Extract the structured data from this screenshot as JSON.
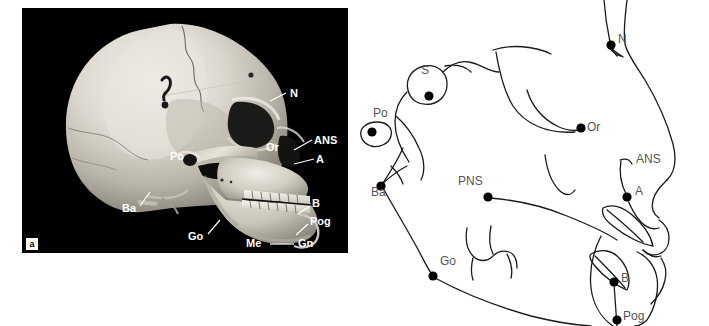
{
  "figure": {
    "panel_letter": "a",
    "background_color": "#ffffff",
    "photo_background_color": "#000000",
    "label_color_photo": "#ffffff",
    "label_color_tracing": "#555555",
    "trace_stroke_color": "#1a1a1a"
  },
  "photo_panel": {
    "name": "skull-photograph",
    "labels": [
      {
        "id": "N",
        "text": "N",
        "x": 290,
        "y": 86,
        "leader": {
          "x1": 286,
          "y1": 93,
          "x2": 268,
          "y2": 101
        }
      },
      {
        "id": "ANS",
        "text": "ANS",
        "x": 317,
        "y": 139,
        "leader": {
          "x1": 315,
          "y1": 147,
          "x2": 295,
          "y2": 155
        }
      },
      {
        "id": "A",
        "text": "A",
        "x": 318,
        "y": 158,
        "leader": {
          "x1": 315,
          "y1": 158,
          "x2": 293,
          "y2": 163
        }
      },
      {
        "id": "Or",
        "text": "Or",
        "x": 268,
        "y": 142,
        "leader": null
      },
      {
        "id": "Po",
        "text": "Po",
        "x": 172,
        "y": 150,
        "leader": null
      },
      {
        "id": "Ba",
        "text": "Ba",
        "x": 130,
        "y": 210,
        "leader": {
          "x1": 143,
          "y1": 205,
          "x2": 153,
          "y2": 190
        }
      },
      {
        "id": "Go",
        "text": "Go",
        "x": 196,
        "y": 237,
        "leader": {
          "x1": 208,
          "y1": 233,
          "x2": 220,
          "y2": 219
        }
      },
      {
        "id": "Me",
        "text": "Me",
        "x": 253,
        "y": 241,
        "leader": {
          "x1": 271,
          "y1": 243,
          "x2": 296,
          "y2": 243
        }
      },
      {
        "id": "Gn",
        "text": "Gn",
        "x": 300,
        "y": 241,
        "leader": null
      },
      {
        "id": "B",
        "text": "B",
        "x": 312,
        "y": 205,
        "leader": {
          "x1": 310,
          "y1": 208,
          "x2": 296,
          "y2": 214
        }
      },
      {
        "id": "Pog",
        "text": "Pog",
        "x": 310,
        "y": 222,
        "leader": {
          "x1": 308,
          "y1": 228,
          "x2": 296,
          "y2": 237
        }
      }
    ]
  },
  "tracing_panel": {
    "name": "cephalometric-tracing",
    "landmarks": [
      {
        "id": "S",
        "text": "S",
        "point_x": 74,
        "point_y": 96,
        "label_x": 66,
        "label_y": 70
      },
      {
        "id": "Po",
        "text": "Po",
        "point_x": 17,
        "point_y": 132,
        "label_x": 20,
        "label_y": 113
      },
      {
        "id": "Ba",
        "text": "Ba",
        "point_x": 26,
        "point_y": 186,
        "label_x": 18,
        "label_y": 191
      },
      {
        "id": "Go",
        "text": "Go",
        "point_x": 78,
        "point_y": 276,
        "label_x": 85,
        "label_y": 260
      },
      {
        "id": "PNS",
        "text": "PNS",
        "point_x": 133,
        "point_y": 197,
        "label_x": 104,
        "label_y": 180
      },
      {
        "id": "Or",
        "text": "Or",
        "point_x": 226,
        "point_y": 128,
        "label_x": 232,
        "label_y": 126
      },
      {
        "id": "N",
        "text": "N",
        "point_x": 256,
        "point_y": 45,
        "label_x": 263,
        "label_y": 38
      },
      {
        "id": "ANS",
        "text": "ANS",
        "point_x": 276,
        "point_y": 163,
        "label_x": 282,
        "label_y": 158
      },
      {
        "id": "A",
        "text": "A",
        "point_x": 272,
        "point_y": 197,
        "label_x": 280,
        "label_y": 190
      },
      {
        "id": "B",
        "text": "B",
        "point_x": 259,
        "point_y": 282,
        "label_x": 266,
        "label_y": 277
      },
      {
        "id": "Pog",
        "text": "Pog",
        "point_x": 262,
        "point_y": 320,
        "label_x": 268,
        "label_y": 314
      }
    ]
  }
}
